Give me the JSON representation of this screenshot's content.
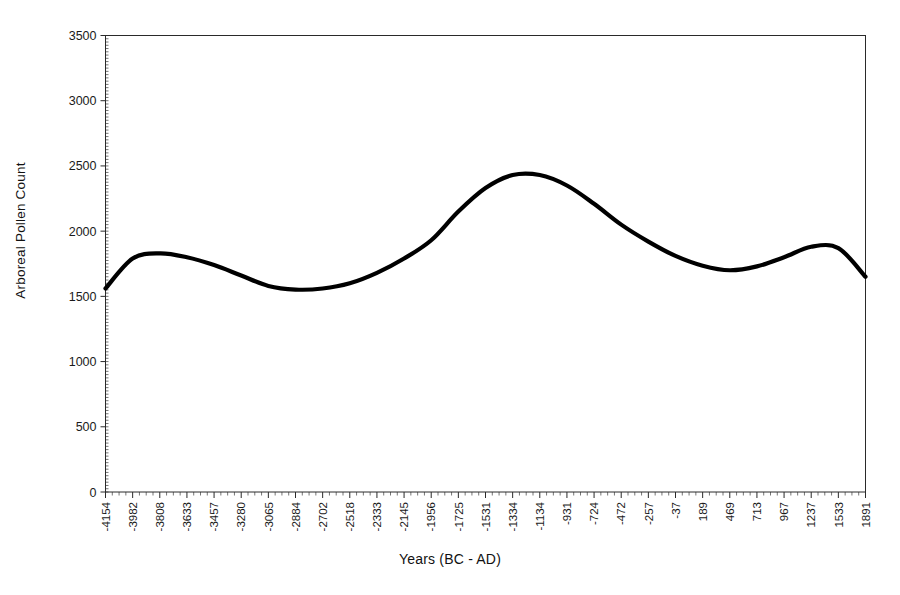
{
  "chart_data": {
    "type": "line",
    "title": "",
    "xlabel": "Years (BC - AD)",
    "ylabel": "Arboreal Pollen Count",
    "xlim": [
      -4154,
      1891
    ],
    "ylim": [
      0,
      3500
    ],
    "grid": false,
    "legend": "none",
    "line_color": "#000000",
    "y_ticks": [
      0,
      500,
      1000,
      1500,
      2000,
      2500,
      3000,
      3500
    ],
    "y_tick_labels": [
      "0",
      "500",
      "1000",
      "1500",
      "2000",
      "2500",
      "3000",
      "3500"
    ],
    "x_tick_labels": [
      "-4154",
      "-3982",
      "-3808",
      "-3633",
      "-3457",
      "-3280",
      "-3065",
      "-2884",
      "-2702",
      "-2518",
      "-2333",
      "-2145",
      "-1956",
      "-1725",
      "-1531",
      "-1334",
      "-1134",
      "-931",
      "-724",
      "-472",
      "-257",
      "-37",
      "189",
      "469",
      "713",
      "967",
      "1237",
      "1533",
      "1891"
    ],
    "x": [
      -4154,
      -3982,
      -3808,
      -3633,
      -3457,
      -3280,
      -3065,
      -2884,
      -2702,
      -2518,
      -2333,
      -2145,
      -1956,
      -1725,
      -1531,
      -1334,
      -1134,
      -931,
      -724,
      -472,
      -257,
      -37,
      189,
      469,
      713,
      967,
      1237,
      1533,
      1891
    ],
    "values": [
      1560,
      1790,
      1830,
      1800,
      1740,
      1660,
      1580,
      1552,
      1560,
      1600,
      1680,
      1790,
      1930,
      2150,
      2330,
      2430,
      2430,
      2350,
      2210,
      2050,
      1920,
      1810,
      1735,
      1700,
      1730,
      1800,
      1880,
      1870,
      1650
    ]
  },
  "axis": {
    "y_title": "Arboreal Pollen Count",
    "x_title": "Years (BC - AD)"
  }
}
